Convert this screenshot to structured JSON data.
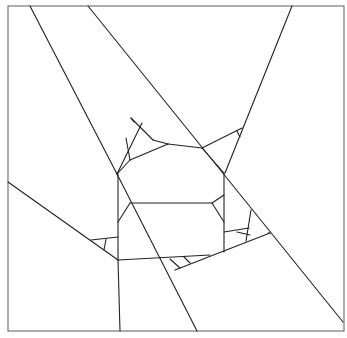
{
  "diagram": {
    "type": "line-partition",
    "stroke_color": "#222222",
    "frame_color": "#777777",
    "background": "#ffffff",
    "frame": {
      "x": 8,
      "y": 6,
      "width": 336,
      "height": 325
    },
    "segments": [
      {
        "id": "s1",
        "x1": 30,
        "y1": 6,
        "x2": 117,
        "y2": 174
      },
      {
        "id": "s2",
        "x1": 88,
        "y1": 6,
        "x2": 343,
        "y2": 322
      },
      {
        "id": "s3",
        "x1": 292,
        "y1": 6,
        "x2": 225,
        "y2": 173
      },
      {
        "id": "s4",
        "x1": 8,
        "y1": 182,
        "x2": 118,
        "y2": 260
      },
      {
        "id": "s5",
        "x1": 118,
        "y1": 260,
        "x2": 120,
        "y2": 331
      },
      {
        "id": "s6",
        "x1": 117,
        "y1": 174,
        "x2": 197,
        "y2": 331
      },
      {
        "id": "s7",
        "x1": 118,
        "y1": 174,
        "x2": 118,
        "y2": 260
      },
      {
        "id": "s8",
        "x1": 224,
        "y1": 173,
        "x2": 224,
        "y2": 252
      },
      {
        "id": "s9",
        "x1": 130,
        "y1": 203,
        "x2": 212,
        "y2": 203
      },
      {
        "id": "s10",
        "x1": 130,
        "y1": 203,
        "x2": 118,
        "y2": 222
      },
      {
        "id": "s11",
        "x1": 212,
        "y1": 203,
        "x2": 224,
        "y2": 195
      },
      {
        "id": "s12",
        "x1": 212,
        "y1": 203,
        "x2": 224,
        "y2": 222
      },
      {
        "id": "s13",
        "x1": 118,
        "y1": 260,
        "x2": 210,
        "y2": 255
      },
      {
        "id": "s14",
        "x1": 175,
        "y1": 270,
        "x2": 270,
        "y2": 233
      },
      {
        "id": "s15",
        "x1": 270,
        "y1": 233,
        "x2": 268,
        "y2": 233
      },
      {
        "id": "s16",
        "x1": 142,
        "y1": 123,
        "x2": 117,
        "y2": 174
      },
      {
        "id": "s17",
        "x1": 130,
        "y1": 160,
        "x2": 168,
        "y2": 144
      },
      {
        "id": "s18",
        "x1": 117,
        "y1": 174,
        "x2": 130,
        "y2": 160
      },
      {
        "id": "s19",
        "x1": 168,
        "y1": 144,
        "x2": 202,
        "y2": 148
      },
      {
        "id": "s20",
        "x1": 202,
        "y1": 148,
        "x2": 224,
        "y2": 173
      },
      {
        "id": "s21",
        "x1": 202,
        "y1": 148,
        "x2": 242,
        "y2": 128
      },
      {
        "id": "s22",
        "x1": 131,
        "y1": 118,
        "x2": 153,
        "y2": 140
      },
      {
        "id": "s23",
        "x1": 153,
        "y1": 140,
        "x2": 168,
        "y2": 144
      },
      {
        "id": "s24",
        "x1": 126,
        "y1": 138,
        "x2": 130,
        "y2": 160
      },
      {
        "id": "s25",
        "x1": 131,
        "y1": 118,
        "x2": 134,
        "y2": 122
      },
      {
        "id": "s26",
        "x1": 237,
        "y1": 131,
        "x2": 240,
        "y2": 137
      },
      {
        "id": "s27",
        "x1": 224,
        "y1": 232,
        "x2": 249,
        "y2": 228
      },
      {
        "id": "s28",
        "x1": 237,
        "y1": 232,
        "x2": 250,
        "y2": 235
      },
      {
        "id": "s29",
        "x1": 251,
        "y1": 210,
        "x2": 246,
        "y2": 241
      },
      {
        "id": "s30",
        "x1": 91,
        "y1": 240,
        "x2": 118,
        "y2": 237
      },
      {
        "id": "s31",
        "x1": 106,
        "y1": 239,
        "x2": 104,
        "y2": 250
      },
      {
        "id": "s32",
        "x1": 170,
        "y1": 259,
        "x2": 180,
        "y2": 268
      },
      {
        "id": "s33",
        "x1": 184,
        "y1": 257,
        "x2": 190,
        "y2": 263
      }
    ]
  }
}
